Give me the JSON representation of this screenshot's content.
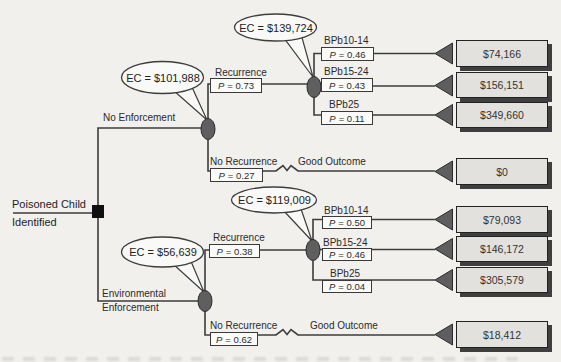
{
  "figure": {
    "root": {
      "line1": "Poisoned Child",
      "line2": "Identified"
    },
    "no_enforcement": {
      "label": "No Enforcement",
      "ec": "EC = $101,988",
      "recurrence": {
        "label": "Recurrence",
        "p_label": "P",
        "p_value": "= 0.73",
        "ec": "EC = $139,724",
        "outcomes": [
          {
            "label": "BPb10-14",
            "p_label": "P",
            "p_value": "= 0.46",
            "value": "$74,166"
          },
          {
            "label": "BPb15-24",
            "p_label": "P",
            "p_value": "= 0.43",
            "value": "$156,151"
          },
          {
            "label": "BPb25",
            "p_label": "P",
            "p_value": "= 0.11",
            "value": "$349,660"
          }
        ]
      },
      "no_recurrence": {
        "label": "No Recurrence",
        "p_label": "P",
        "p_value": "= 0.27",
        "outcome_label": "Good Outcome",
        "value": "$0"
      }
    },
    "environmental_enforcement": {
      "label_line1": "Environmental",
      "label_line2": "Enforcement",
      "ec": "EC = $56,639",
      "recurrence": {
        "label": "Recurrence",
        "p_label": "P",
        "p_value": "= 0.38",
        "ec": "EC = $119,009",
        "outcomes": [
          {
            "label": "BPb10-14",
            "p_label": "P",
            "p_value": "= 0.50",
            "value": "$79,093"
          },
          {
            "label": "BPb15-24",
            "p_label": "P",
            "p_value": "= 0.46",
            "value": "$146,172"
          },
          {
            "label": "BPb25",
            "p_label": "P",
            "p_value": "= 0.04",
            "value": "$305,579"
          }
        ]
      },
      "no_recurrence": {
        "label": "No Recurrence",
        "p_label": "P",
        "p_value": "= 0.62",
        "outcome_label": "Good Outcome",
        "value": "$18,412"
      }
    },
    "colors": {
      "background": "#f1f0ed",
      "line": "#3d3d3d",
      "chance_node_fill": "#5f5f5f",
      "terminal_triangle_fill": "#5e5e5e",
      "value_box_fill": "#e2e1de",
      "value_box_shadow": "#3f3f3f"
    }
  }
}
